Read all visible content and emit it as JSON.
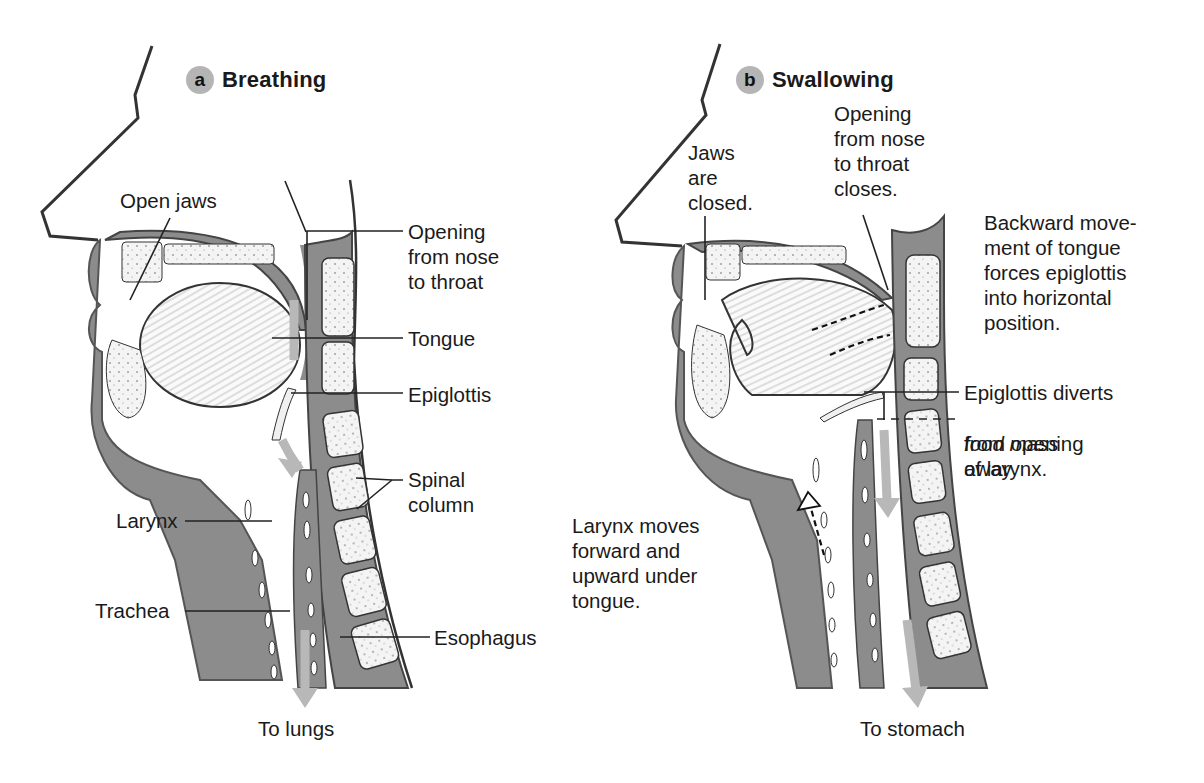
{
  "colors": {
    "tissue_gray": "#8c8c8c",
    "bone_fill": "#f4f4f4",
    "arrow_gray": "#b8b8b8",
    "badge_gray": "#b5b5b5",
    "line": "#222222"
  },
  "panels": [
    {
      "badge": "a",
      "title": "Breathing",
      "labels": {
        "open_jaws": "Open jaws",
        "opening": "Opening\nfrom nose\nto throat",
        "tongue": "Tongue",
        "epiglottis": "Epiglottis",
        "spinal_column": "Spinal\ncolumn",
        "larynx": "Larynx",
        "trachea": "Trachea",
        "esophagus": "Esophagus",
        "destination": "To lungs"
      }
    },
    {
      "badge": "b",
      "title": "Swallowing",
      "labels": {
        "jaws_closed": "Jaws\nare\nclosed.",
        "opening_closes": "Opening\nfrom nose\nto throat\ncloses.",
        "backward_movement": "Backward move-\nment of tongue\nforces epiglottis\ninto horizontal\nposition.",
        "epiglottis_diverts": "Epiglottis diverts",
        "food_mass": "food mass",
        "away": "away",
        "from_opening": "from opening\nof larynx.",
        "larynx_moves": "Larynx moves\nforward and\nupward under\ntongue.",
        "destination": "To stomach"
      }
    }
  ]
}
